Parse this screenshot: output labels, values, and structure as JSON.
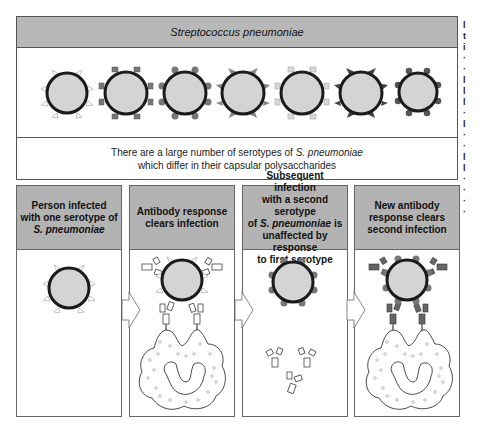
{
  "figure": {
    "title": "Streptococcus pneumoniae",
    "caption_line1_prefix": "There are a large number of serotypes of ",
    "caption_line1_italic": "S. pneumoniae",
    "caption_line2": "which differ in their capsular polysaccharides",
    "serotypes": [
      {
        "marker": "triangle",
        "fill": "#ffffff"
      },
      {
        "marker": "square",
        "fill": "#777777"
      },
      {
        "marker": "dot",
        "fill": "#777777"
      },
      {
        "marker": "triangle",
        "fill": "#888888"
      },
      {
        "marker": "square",
        "fill": "#d8d8d8"
      },
      {
        "marker": "triangle",
        "fill": "#444444"
      },
      {
        "marker": "dot",
        "fill": "#555555"
      }
    ],
    "colors": {
      "header_gray": "#b3b3b3",
      "bacterium_fill": "#d4d4d4",
      "bacterium_outline": "#1a1a1a",
      "frame": "#555555"
    }
  },
  "panels": [
    {
      "line1": "Person infected",
      "line2": "with one serotype of",
      "line3_italic": "S. pneumoniae",
      "line4": ""
    },
    {
      "line1": "Antibody  response",
      "line2": "clears  infection",
      "line3_italic": "",
      "line4": ""
    },
    {
      "line1": "Subsequent infection",
      "line2": "with a second serotype",
      "line3_prefix": "of ",
      "line3_italic": "S. pneumoniae",
      "line3_suffix": " is",
      "line4": "unaffected by response",
      "line5": "to first serotype"
    },
    {
      "line1": "New antibody",
      "line2": "response clears",
      "line3_italic": "",
      "line4": "second infection"
    }
  ],
  "edge_fragment": "l\nt\ni\n·\n·\nl\nl\nl\n·\nl\n·\n·\nl\nl\n·\n·\n·\n·"
}
